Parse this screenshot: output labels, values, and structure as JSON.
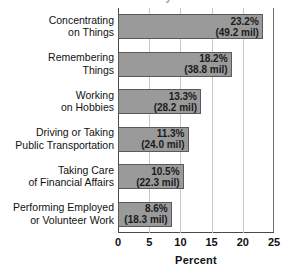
{
  "title_remnant": "2015 Disability Data",
  "chart_data": {
    "type": "bar",
    "orientation": "horizontal",
    "title": "",
    "xlabel": "Percent",
    "ylabel": "",
    "xlim": [
      0,
      25
    ],
    "xticks": [
      "0",
      "5",
      "10",
      "15",
      "20",
      "25"
    ],
    "grid": true,
    "legend": "none",
    "bar_color": "#9a9a9a",
    "bar_border_color": "#5a5a5a",
    "categories": [
      "Concentrating on Things",
      "Remembering Things",
      "Working on Hobbies",
      "Driving or Taking Public Transportation",
      "Taking Care of Financial Affairs",
      "Performing Employed or Volunteer Work"
    ],
    "values": [
      23.2,
      18.2,
      13.3,
      11.3,
      10.5,
      8.6
    ],
    "rows": [
      {
        "label_line1": "Concentrating",
        "label_line2": "on Things",
        "value": 23.2,
        "percent_label": "23.2%",
        "millions_label": "(49.2 mil)"
      },
      {
        "label_line1": "Remembering",
        "label_line2": "Things",
        "value": 18.2,
        "percent_label": "18.2%",
        "millions_label": "(38.8 mil)"
      },
      {
        "label_line1": "Working",
        "label_line2": "on Hobbies",
        "value": 13.3,
        "percent_label": "13.3%",
        "millions_label": "(28.2 mil)"
      },
      {
        "label_line1": "Driving or Taking",
        "label_line2": "Public Transportation",
        "value": 11.3,
        "percent_label": "11.3%",
        "millions_label": "(24.0 mil)"
      },
      {
        "label_line1": "Taking Care",
        "label_line2": "of Financial Affairs",
        "value": 10.5,
        "percent_label": "10.5%",
        "millions_label": "(22.3 mil)"
      },
      {
        "label_line1": "Performing Employed",
        "label_line2": "or Volunteer Work",
        "value": 8.6,
        "percent_label": "8.6%",
        "millions_label": "(18.3 mil)"
      }
    ]
  }
}
